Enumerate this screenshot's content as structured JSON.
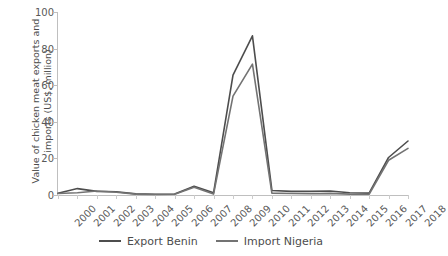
{
  "chart_data": {
    "type": "line",
    "title": "",
    "xlabel": "",
    "ylabel": "Value of chicken meat exports and\nimports (US$, million)",
    "categories": [
      "2000",
      "2001",
      "2002",
      "2003",
      "2004",
      "2005",
      "2006",
      "2007",
      "2008",
      "2009",
      "2010",
      "2011",
      "2012",
      "2013",
      "2014",
      "2015",
      "2016",
      "2017",
      "2018"
    ],
    "ylim": [
      0,
      100
    ],
    "yticks": [
      0,
      20,
      40,
      60,
      80,
      100
    ],
    "grid": false,
    "legend_position": "bottom",
    "series": [
      {
        "name": "Export Benin",
        "color": "#4d4d4d",
        "values": [
          1,
          3.5,
          2,
          1.8,
          0.6,
          0.4,
          0.5,
          4.8,
          1.2,
          65.5,
          87,
          2.5,
          2,
          2,
          2.2,
          1.2,
          1,
          20.5,
          29.5
        ]
      },
      {
        "name": "Import Nigeria",
        "color": "#737373",
        "values": [
          0.8,
          1.2,
          2.2,
          1.5,
          0.5,
          0.3,
          0.4,
          4.2,
          0.5,
          54,
          71.5,
          1,
          0.8,
          0.7,
          0.9,
          0.5,
          0.4,
          19,
          25.5
        ]
      }
    ]
  },
  "legend": {
    "items": [
      {
        "label": "Export Benin",
        "color": "#4d4d4d"
      },
      {
        "label": "Import Nigeria",
        "color": "#737373"
      }
    ]
  },
  "colors": {
    "axis": "#bfbfbf",
    "text": "#595959",
    "series_1": "#4d4d4d",
    "series_2": "#737373"
  }
}
